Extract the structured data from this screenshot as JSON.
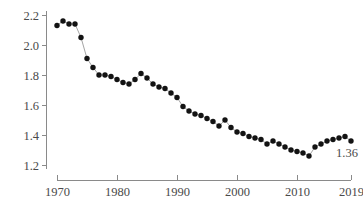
{
  "chart_data": {
    "type": "line",
    "title": "",
    "subtitle": "",
    "xlabel": "",
    "ylabel": "",
    "grid": false,
    "legend": null,
    "marker": "filled-circle",
    "line_color": "#9a9a9a",
    "marker_color": "#131313",
    "axis_color": "#8a8a8a",
    "text_color": "#4a4a4a",
    "xlim": [
      1970,
      2019
    ],
    "ylim": [
      1.2,
      2.2
    ],
    "xticks": [
      1970,
      1980,
      1990,
      2000,
      2010,
      2019
    ],
    "xtick_labels": [
      "1970",
      "1980",
      "1990",
      "2000",
      "2010",
      "2019"
    ],
    "yticks": [
      1.2,
      1.4,
      1.6,
      1.8,
      2.0,
      2.2
    ],
    "ytick_labels": [
      "1.2",
      "1.4",
      "1.6",
      "1.8",
      "2.0",
      "2.2"
    ],
    "annotations": [
      {
        "text": "1.36",
        "x": 2019,
        "y": 1.36,
        "dx": -4,
        "dy": 16
      }
    ],
    "x": [
      1970,
      1971,
      1972,
      1973,
      1974,
      1975,
      1976,
      1977,
      1978,
      1979,
      1980,
      1981,
      1982,
      1983,
      1984,
      1985,
      1986,
      1987,
      1988,
      1989,
      1990,
      1991,
      1992,
      1993,
      1994,
      1995,
      1996,
      1997,
      1998,
      1999,
      2000,
      2001,
      2002,
      2003,
      2004,
      2005,
      2006,
      2007,
      2008,
      2009,
      2010,
      2011,
      2012,
      2013,
      2014,
      2015,
      2016,
      2017,
      2018,
      2019
    ],
    "values": [
      2.13,
      2.16,
      2.14,
      2.14,
      2.05,
      1.91,
      1.85,
      1.8,
      1.8,
      1.79,
      1.77,
      1.75,
      1.74,
      1.77,
      1.81,
      1.78,
      1.74,
      1.72,
      1.71,
      1.68,
      1.65,
      1.59,
      1.56,
      1.54,
      1.53,
      1.51,
      1.49,
      1.46,
      1.5,
      1.45,
      1.42,
      1.41,
      1.39,
      1.38,
      1.37,
      1.34,
      1.36,
      1.34,
      1.32,
      1.3,
      1.29,
      1.28,
      1.26,
      1.32,
      1.34,
      1.36,
      1.37,
      1.38,
      1.39,
      1.36
    ]
  }
}
